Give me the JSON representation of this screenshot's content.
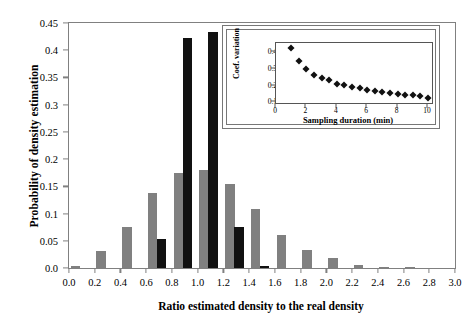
{
  "chart_data": {
    "type": "bar",
    "title": "",
    "xlabel": "Ratio estimated density to the real density",
    "ylabel": "Probability of density estimation",
    "xlim": [
      0.0,
      3.0
    ],
    "ylim": [
      0.0,
      0.45
    ],
    "grid": false,
    "legend": "none",
    "xticks": [
      "0.0",
      "0.2",
      "0.4",
      "0.6",
      "0.8",
      "1.0",
      "1.2",
      "1.4",
      "1.6",
      "1.8",
      "2.0",
      "2.2",
      "2.4",
      "2.6",
      "2.8",
      "3.0"
    ],
    "xtick_values": [
      0.0,
      0.2,
      0.4,
      0.6,
      0.8,
      1.0,
      1.2,
      1.4,
      1.6,
      1.8,
      2.0,
      2.2,
      2.4,
      2.6,
      2.8,
      3.0
    ],
    "yticks": [
      "0.0",
      "0.05",
      "0.1",
      "0.15",
      "0.2",
      "0.25",
      "0.3",
      "0.35",
      "0.4",
      "0.45"
    ],
    "ytick_values": [
      0.0,
      0.05,
      0.1,
      0.15,
      0.2,
      0.25,
      0.3,
      0.35,
      0.4,
      0.45
    ],
    "series": [
      {
        "name": "gray",
        "color": "#808080",
        "x": [
          0.05,
          0.25,
          0.45,
          0.65,
          0.85,
          1.05,
          1.25,
          1.45,
          1.65,
          1.85,
          2.05,
          2.25,
          2.45,
          2.65
        ],
        "values": [
          0.003,
          0.031,
          0.076,
          0.137,
          0.175,
          0.18,
          0.154,
          0.108,
          0.061,
          0.033,
          0.018,
          0.006,
          0.002,
          0.001
        ]
      },
      {
        "name": "black",
        "color": "#111111",
        "x": [
          0.72,
          0.92,
          1.12,
          1.32,
          1.52
        ],
        "values": [
          0.054,
          0.423,
          0.434,
          0.075,
          0.004
        ]
      }
    ],
    "inset": {
      "type": "scatter",
      "xlabel": "Sampling duration (min)",
      "ylabel": "Coef. variation",
      "xlim": [
        0,
        10.4
      ],
      "ylim": [
        0.085,
        0.455
      ],
      "xticks": [
        "0",
        "2",
        "4",
        "6",
        "8",
        "10"
      ],
      "xtick_values": [
        0,
        2,
        4,
        6,
        8,
        10
      ],
      "yticks": [
        "0.1",
        "0.2",
        "0.3",
        "0.4"
      ],
      "ytick_values": [
        0.1,
        0.2,
        0.3,
        0.4
      ],
      "marker": "diamond",
      "marker_color": "#111111",
      "x": [
        1.0,
        1.5,
        2.0,
        2.5,
        3.0,
        3.5,
        4.0,
        4.5,
        5.0,
        5.5,
        6.0,
        6.5,
        7.0,
        7.5,
        8.0,
        8.5,
        9.0,
        9.5,
        10.0
      ],
      "values": [
        0.428,
        0.345,
        0.297,
        0.267,
        0.247,
        0.232,
        0.213,
        0.203,
        0.192,
        0.184,
        0.177,
        0.17,
        0.163,
        0.157,
        0.15,
        0.145,
        0.142,
        0.136,
        0.128
      ]
    }
  }
}
